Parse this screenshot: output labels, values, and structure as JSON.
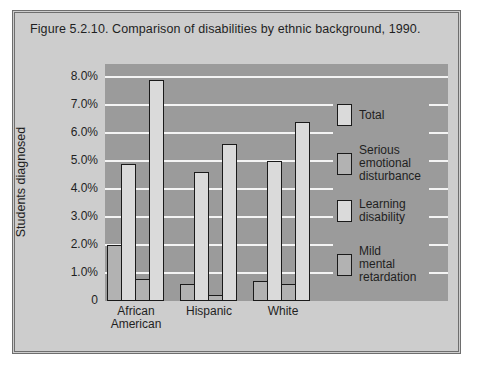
{
  "figure_title": "Figure 5.2.10. Comparison of disabilities by ethnic background, 1990.",
  "chart_data": {
    "type": "bar",
    "title": "Figure 5.2.10. Comparison of disabilities by ethnic background, 1990.",
    "ylabel": "Students diagnosed",
    "xlabel": "",
    "unit": "percent of students",
    "categories": [
      "African\nAmerican",
      "Hispanic",
      "White"
    ],
    "series": [
      {
        "name": "Serious emotional disturbance",
        "swatch": "medium",
        "values": [
          2.0,
          0.6,
          0.7
        ]
      },
      {
        "name": "Learning disability",
        "swatch": "light",
        "values": [
          4.9,
          4.6,
          5.0
        ]
      },
      {
        "name": "Mild mental retardation",
        "swatch": "medium",
        "values": [
          0.8,
          0.2,
          0.6
        ]
      },
      {
        "name": "Total",
        "swatch": "light",
        "values": [
          7.9,
          5.6,
          6.4
        ]
      }
    ],
    "legend": [
      {
        "label": "Total",
        "swatch": "light"
      },
      {
        "label": "Serious\nemotional\ndisturbance",
        "swatch": "medium"
      },
      {
        "label": "Learning\ndisability",
        "swatch": "light"
      },
      {
        "label": "Mild\nmental\nretardation",
        "swatch": "medium"
      }
    ],
    "legend_position": "inside-right",
    "grid": true,
    "ylim": [
      0,
      8.4
    ],
    "y_ticks": [
      {
        "value": 8,
        "label": "8.0%"
      },
      {
        "value": 7,
        "label": "7.0%"
      },
      {
        "value": 6,
        "label": "6.0%"
      },
      {
        "value": 5,
        "label": "5.0%"
      },
      {
        "value": 4,
        "label": "4.0%"
      },
      {
        "value": 3,
        "label": "3.0%"
      },
      {
        "value": 2,
        "label": "2.0%"
      },
      {
        "value": 1,
        "label": "1.0%"
      },
      {
        "value": 0,
        "label": "0"
      }
    ],
    "colors": {
      "light": "#dadada",
      "medium": "#b2b2b2",
      "panel": "#9b9b9b",
      "gridline": "#f4f4f4",
      "bar_outline": "#1a1a1a",
      "card_background": "#cdcdcd",
      "card_border": "#6e6e6e"
    }
  }
}
